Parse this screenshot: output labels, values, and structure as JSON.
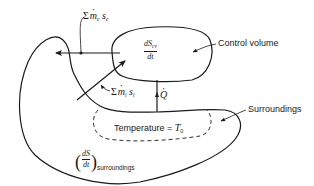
{
  "diagram": {
    "type": "control-volume-entropy-diagram",
    "labels": {
      "control_volume": "Control volume",
      "surroundings": "Surroundings",
      "temperature_label": "Temperature = ",
      "temperature_value": "T",
      "temperature_sub": "0",
      "exit_flow_sum": "Σ",
      "exit_flow_m": "m",
      "exit_flow_m_sub": "e",
      "exit_flow_s": "s",
      "exit_flow_s_sub": "e",
      "inlet_flow_sum": "Σ",
      "inlet_flow_m": "m",
      "inlet_flow_m_sub": "i",
      "inlet_flow_s": "s",
      "inlet_flow_s_sub": "i",
      "heat_transfer": "Q",
      "cv_rate_num": "dS",
      "cv_rate_num_sub": "cv",
      "cv_rate_den": "dt",
      "surr_rate_num": "dS",
      "surr_rate_den": "dt",
      "surr_rate_sub": "surroundings",
      "paren_open": "(",
      "paren_close": ")"
    },
    "colors": {
      "stroke": "#1a1a1a",
      "background": "#ffffff"
    }
  }
}
